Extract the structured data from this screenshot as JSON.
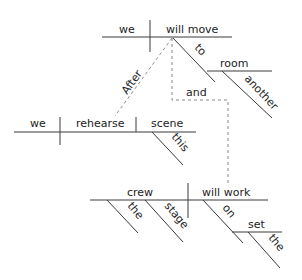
{
  "diagram": {
    "type": "sentence-diagram",
    "sentence_words": {
      "main_subject": "we",
      "main_verb": "will move",
      "prep_to": "to",
      "prep_obj_room": "room",
      "modifier_another": "another",
      "sub_conj_after": "After",
      "sub_subject": "we",
      "sub_verb": "rehearse",
      "sub_object": "scene",
      "modifier_this": "this",
      "conj_and": "and",
      "second_subject": "crew",
      "modifier_the_1": "the",
      "modifier_stage": "stage",
      "second_verb": "will work",
      "prep_on": "on",
      "prep_obj_set": "set",
      "modifier_the_2": "the"
    },
    "colors": {
      "line": "#3a3a3a",
      "dashed_line": "#8a8a8a",
      "text": "#222222",
      "background": "#ffffff"
    }
  }
}
